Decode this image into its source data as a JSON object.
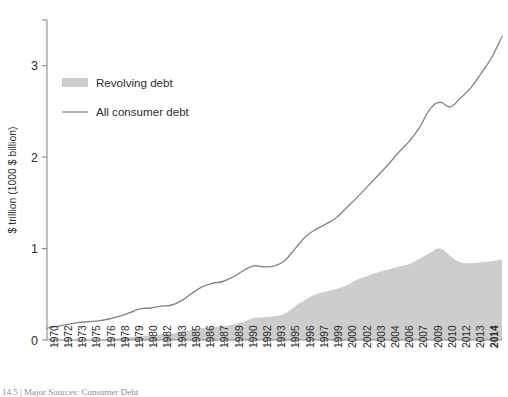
{
  "chart_data": {
    "type": "area",
    "title": "",
    "xlabel": "",
    "ylabel": "$ trillion (1000 $ billion)",
    "ylim": [
      0,
      3.5
    ],
    "yticks": [
      0,
      1,
      2,
      3
    ],
    "ytick_labels": [
      "0",
      "1",
      "2",
      "3"
    ],
    "grid": false,
    "legend_position": "upper-left",
    "legend": [
      {
        "label": "Revolving debt",
        "marker": "filled-swatch",
        "color": "#cdcdcd"
      },
      {
        "label": "All consumer debt",
        "marker": "line",
        "color": "#858585"
      }
    ],
    "x": [
      1970,
      1971,
      1972,
      1973,
      1974,
      1975,
      1976,
      1977,
      1978,
      1979,
      1980,
      1981,
      1982,
      1983,
      1984,
      1985,
      1986,
      1987,
      1988,
      1989,
      1990,
      1991,
      1992,
      1993,
      1994,
      1995,
      1996,
      1997,
      1998,
      1999,
      2000,
      2001,
      2002,
      2003,
      2004,
      2005,
      2006,
      2007,
      2008,
      2009,
      2010,
      2011,
      2012,
      2013,
      2014
    ],
    "xtick_labels": [
      "1970",
      "1972",
      "1973",
      "1975",
      "1976",
      "1978",
      "1979",
      "1980",
      "1982",
      "1983",
      "1985",
      "1986",
      "1987",
      "1989",
      "1990",
      "1992",
      "1993",
      "1995",
      "1996",
      "1997",
      "1999",
      "2000",
      "2002",
      "2003",
      "2004",
      "2006",
      "2007",
      "2009",
      "2010",
      "2012",
      "2013",
      "2014"
    ],
    "xtick_bold_last": true,
    "series": [
      {
        "name": "All consumer debt",
        "type": "line",
        "color": "#858585",
        "values": [
          0.13,
          0.15,
          0.17,
          0.19,
          0.2,
          0.21,
          0.23,
          0.26,
          0.3,
          0.34,
          0.35,
          0.37,
          0.38,
          0.43,
          0.51,
          0.58,
          0.62,
          0.64,
          0.69,
          0.76,
          0.81,
          0.8,
          0.81,
          0.87,
          1.0,
          1.13,
          1.21,
          1.27,
          1.34,
          1.45,
          1.56,
          1.68,
          1.8,
          1.92,
          2.05,
          2.17,
          2.32,
          2.52,
          2.6,
          2.55,
          2.65,
          2.76,
          2.92,
          3.09,
          3.32
        ]
      },
      {
        "name": "Revolving debt",
        "type": "area",
        "color": "#cdcdcd",
        "values": [
          0.0,
          0.0,
          0.0,
          0.0,
          0.0,
          0.0,
          0.01,
          0.02,
          0.03,
          0.04,
          0.05,
          0.06,
          0.07,
          0.09,
          0.11,
          0.13,
          0.14,
          0.15,
          0.17,
          0.2,
          0.24,
          0.25,
          0.26,
          0.29,
          0.37,
          0.44,
          0.5,
          0.53,
          0.56,
          0.6,
          0.66,
          0.7,
          0.74,
          0.77,
          0.8,
          0.83,
          0.89,
          0.95,
          1.0,
          0.92,
          0.85,
          0.84,
          0.85,
          0.86,
          0.88
        ]
      }
    ]
  },
  "caption": "14.5 | Major Sources: Consumer Debt"
}
